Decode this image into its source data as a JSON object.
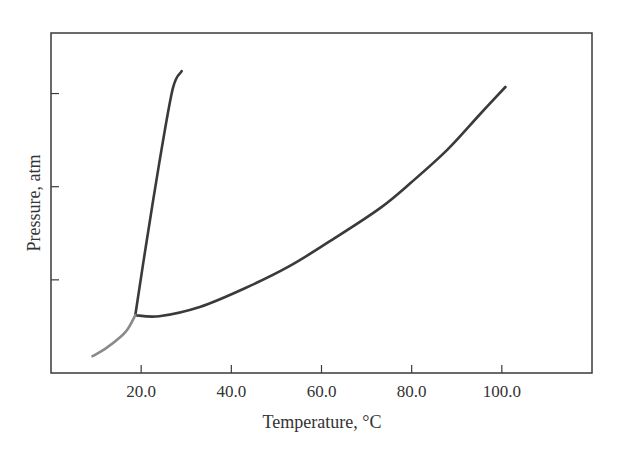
{
  "chart_data": {
    "type": "line",
    "title": "",
    "xlabel": "Temperature, °C",
    "ylabel": "Pressure, atm",
    "xlim": [
      0,
      120
    ],
    "ylim": [
      0,
      3.65
    ],
    "grid": false,
    "legend": null,
    "x_ticks": [
      20.0,
      40.0,
      60.0,
      80.0,
      100.0
    ],
    "x_tick_labels": [
      "20.0",
      "40.0",
      "60.0",
      "80.0",
      "100.0"
    ],
    "y_ticks": [
      1,
      2,
      3
    ],
    "y_tick_labels": [
      "",
      "",
      ""
    ],
    "series": [
      {
        "name": "steep-boundary",
        "color": "#3a3a3a",
        "x": [
          18.7,
          21.0,
          24.0,
          27.0,
          29.0
        ],
        "y": [
          0.62,
          1.35,
          2.25,
          3.05,
          3.24
        ]
      },
      {
        "name": "long-boundary",
        "color": "#3a3a3a",
        "x": [
          18.7,
          24.0,
          33.0,
          43.0,
          53.0,
          63.0,
          73.0,
          80.0,
          88.0,
          95.0,
          100.8
        ],
        "y": [
          0.62,
          0.61,
          0.71,
          0.91,
          1.15,
          1.45,
          1.77,
          2.05,
          2.4,
          2.77,
          3.07
        ]
      },
      {
        "name": "low-temperature-curve",
        "color": "#8a8a8a",
        "x": [
          9.2,
          12.0,
          15.0,
          17.0,
          18.7
        ],
        "y": [
          0.18,
          0.26,
          0.37,
          0.47,
          0.62
        ]
      }
    ]
  }
}
